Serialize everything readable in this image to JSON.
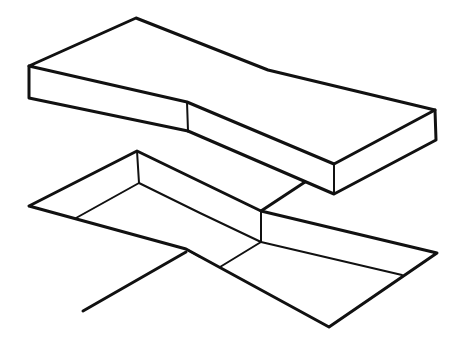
{
  "diagram": {
    "stroke_color": "#111111",
    "background": "#ffffff",
    "parts": [
      {
        "name": "top-block",
        "label": ""
      },
      {
        "name": "cavity",
        "label": ""
      },
      {
        "name": "leader-line",
        "label": ""
      }
    ]
  }
}
